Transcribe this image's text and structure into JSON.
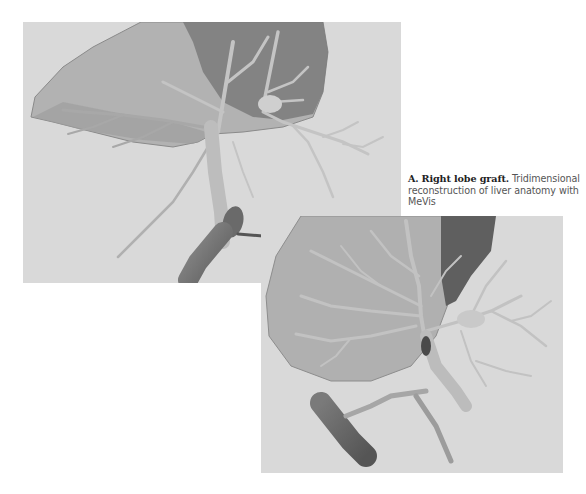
{
  "figure": {
    "caption": {
      "label": "A.",
      "title": "Right lobe graft.",
      "text": "Tridimensional reconstruction of liver anatomy with MeVis"
    },
    "panels": [
      {
        "id": "panel-a",
        "description": "3D reconstruction of right lobe graft, anterior view with hepatic veins and portal branches"
      },
      {
        "id": "panel-b",
        "description": "3D reconstruction of right lobe graft, alternate view with vena cava"
      }
    ],
    "colors": {
      "background": "#d9d9d9",
      "liver_parenchyma": "#a9a9a9",
      "liver_dark_region": "#6e6e6e",
      "vessel_light": "#c8c8c8",
      "vessel_mid": "#9a9a9a",
      "vena_cava": "#7c7c7c"
    }
  }
}
